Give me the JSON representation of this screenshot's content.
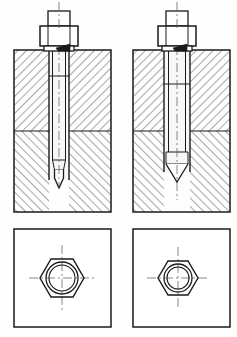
{
  "drawing": {
    "title": "Stud fastening assembly — two variants",
    "type": "engineering-section-drawing",
    "canvas": {
      "width": 237,
      "height": 337,
      "background": "#fefefe"
    },
    "line_color": "#1a1a1a",
    "hatch_color": "#3c3c3c",
    "fill_color": "#ffffff",
    "shank_fill": "#f2f2f2",
    "centerline_color": "#555555",
    "views": [
      {
        "id": "left-section",
        "label": "Left section view",
        "block": {
          "x": 14,
          "y": 50,
          "width": 97,
          "height": 162
        },
        "split_y": 131,
        "upper_hatch_direction": "forward",
        "lower_hatch_direction": "backward",
        "hatch_spacing": 6,
        "hole": {
          "x": 49,
          "y": 50,
          "width": 20,
          "depth_to": 180
        },
        "axis_x": 59,
        "thread_line_y": 76,
        "shank_taper_y": 160,
        "tip_apex_y": 188,
        "nut": {
          "body": {
            "x": 40,
            "y": 26,
            "width": 38,
            "height": 20
          },
          "collar": {
            "x": 44,
            "y": 46,
            "width": 30,
            "height": 5
          },
          "upper": {
            "x": 48,
            "y": 11,
            "width": 22,
            "height": 15
          }
        }
      },
      {
        "id": "right-section",
        "label": "Right section view",
        "block": {
          "x": 133,
          "y": 50,
          "width": 97,
          "height": 162
        },
        "split_y": 131,
        "upper_hatch_direction": "forward",
        "lower_hatch_direction": "backward",
        "hatch_spacing": 6,
        "hole": {
          "x": 164,
          "y": 50,
          "width": 26,
          "depth_to": 172
        },
        "axis_x": 177,
        "thread_line_y": 84,
        "shank_taper_y": 152,
        "tip_apex_y": 182,
        "nut": {
          "body": {
            "x": 158,
            "y": 26,
            "width": 38,
            "height": 20
          },
          "collar": {
            "x": 162,
            "y": 46,
            "width": 30,
            "height": 5
          },
          "upper": {
            "x": 166,
            "y": 11,
            "width": 22,
            "height": 15
          }
        }
      }
    ],
    "plan_views": [
      {
        "id": "left-plan",
        "label": "Left plan view",
        "frame": {
          "x": 14,
          "y": 229,
          "width": 97,
          "height": 98
        },
        "center": {
          "x": 62,
          "y": 278
        },
        "hex_radius": 22,
        "circle_outer_r": 16,
        "circle_inner_r": 13,
        "centerline_extent": 33
      },
      {
        "id": "right-plan",
        "label": "Right plan view",
        "frame": {
          "x": 133,
          "y": 229,
          "width": 97,
          "height": 98
        },
        "center": {
          "x": 178,
          "y": 278
        },
        "hex_radius": 20,
        "circle_outer_r": 14,
        "circle_inner_r": 11,
        "centerline_extent": 31
      }
    ]
  }
}
